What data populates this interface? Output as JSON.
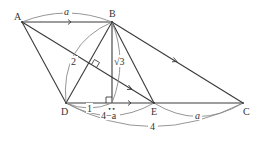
{
  "figure": {
    "points": {
      "A": {
        "label": "A",
        "x": 22,
        "y": 22
      },
      "B": {
        "label": "B",
        "x": 112,
        "y": 22
      },
      "D": {
        "label": "D",
        "x": 66,
        "y": 103
      },
      "H": {
        "label": "H",
        "x": 112,
        "y": 103
      },
      "E": {
        "label": "E",
        "x": 154,
        "y": 103
      },
      "C": {
        "label": "C",
        "x": 243,
        "y": 103
      }
    },
    "segments": [
      "AB",
      "AD",
      "AE",
      "BD",
      "BH",
      "BE",
      "BC",
      "DC"
    ],
    "lengths": {
      "AB": "a",
      "BD": "2",
      "BH": "√3",
      "DH": "1",
      "DE": "4−a",
      "EC": "a",
      "DC": "4"
    },
    "right_angles": [
      "BHD",
      "BD⊥AE"
    ],
    "parallel_marks": [
      "AB",
      "DC",
      "BC",
      "AE"
    ]
  }
}
